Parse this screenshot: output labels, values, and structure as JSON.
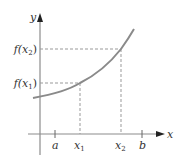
{
  "diagram": {
    "type": "function-graph",
    "axes": {
      "x_label": "x",
      "y_label": "y"
    },
    "x_ticks": [
      {
        "label": "a",
        "sub": ""
      },
      {
        "label": "x",
        "sub": "1"
      },
      {
        "label": "x",
        "sub": "2"
      },
      {
        "label": "b",
        "sub": ""
      }
    ],
    "y_ticks": [
      {
        "label": "f(x",
        "sub": "2",
        "close": ")"
      },
      {
        "label": "f(x",
        "sub": "1",
        "close": ")"
      }
    ],
    "colors": {
      "axis": "#8c8c8c",
      "curve": "#8a8a8a",
      "dashed": "#999999",
      "text": "#333333"
    }
  }
}
